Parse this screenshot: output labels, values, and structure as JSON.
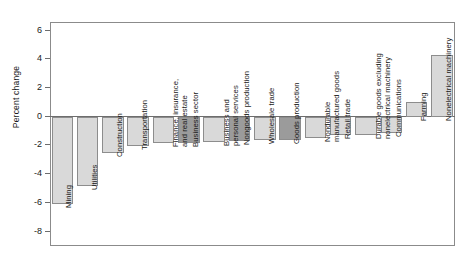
{
  "chart_data": {
    "type": "bar",
    "title": "",
    "xlabel": "",
    "ylabel": "Percent change",
    "ylim": [
      -9,
      6.6
    ],
    "yticks": [
      6,
      4,
      2,
      0,
      -2,
      -4,
      -6,
      -8
    ],
    "ytick_labels": [
      "6",
      "4",
      "2",
      "0",
      "-2",
      "-4",
      "-6",
      "-8"
    ],
    "grid": false,
    "legend": "none",
    "categories": [
      "Mining",
      "Utilities",
      "Construction",
      "Transportation",
      "Finance, insurance,\nand real estate",
      "Business sector",
      "Business and\npersonal services",
      "Nongoods production",
      "Wholesale trade",
      "Goods production",
      "Nondurable\nmanufactured goods",
      "Retail trade",
      "Durable goods excluding\nnonelectrical machinery",
      "Communications",
      "Farming",
      "Nonelectrical machinery"
    ],
    "values": [
      -6.1,
      -4.8,
      -2.5,
      -2.05,
      -1.85,
      -1.8,
      -1.75,
      -1.7,
      -1.65,
      -1.6,
      -1.45,
      -1.3,
      -1.25,
      -1.1,
      1.0,
      4.3
    ],
    "shades": [
      "light",
      "light",
      "light",
      "light",
      "light",
      "dark",
      "light",
      "dark",
      "light",
      "dark",
      "light",
      "light",
      "light",
      "light",
      "light",
      "light"
    ],
    "colors": {
      "bar_light": "#d9d9d9",
      "bar_dark": "#9b9b9b",
      "bar_border": "#8d8d8d",
      "axis": "#6d6d6d",
      "frame": "#8b8b8b",
      "text": "#1a1a1a",
      "background": "#ffffff"
    }
  }
}
